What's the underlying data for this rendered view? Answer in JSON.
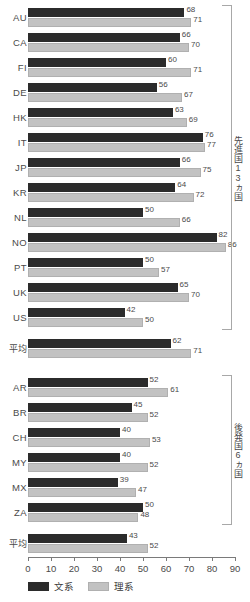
{
  "chart_data": {
    "type": "bar",
    "orientation": "horizontal",
    "title": "",
    "xlabel": "",
    "ylabel": "",
    "xlim": [
      0,
      90
    ],
    "xticks": [
      0,
      10,
      20,
      30,
      40,
      50,
      60,
      70,
      80,
      90
    ],
    "grid": false,
    "legend_position": "bottom-left",
    "series": [
      {
        "name": "文系",
        "color": "#2b2b2b"
      },
      {
        "name": "理系",
        "color": "#c2c2c2"
      }
    ],
    "groups": [
      {
        "bracket_label": "先進国13ヵ国",
        "categories": [
          "AU",
          "CA",
          "FI",
          "DE",
          "HK",
          "IT",
          "JP",
          "KR",
          "NL",
          "NO",
          "PT",
          "UK",
          "US"
        ],
        "values": {
          "文系": [
            68,
            66,
            60,
            56,
            63,
            76,
            66,
            64,
            50,
            82,
            50,
            65,
            42
          ],
          "理系": [
            71,
            70,
            71,
            67,
            69,
            77,
            75,
            72,
            66,
            86,
            57,
            70,
            50
          ]
        },
        "summary": {
          "label": "平均",
          "values": {
            "文系": 62,
            "理系": 71
          }
        }
      },
      {
        "bracket_label": "後発国6ヵ国",
        "categories": [
          "AR",
          "BR",
          "CH",
          "MY",
          "MX",
          "ZA"
        ],
        "values": {
          "文系": [
            52,
            45,
            40,
            40,
            39,
            50
          ],
          "理系": [
            61,
            52,
            53,
            52,
            47,
            48
          ]
        },
        "summary": {
          "label": "平均",
          "values": {
            "文系": 43,
            "理系": 52
          }
        }
      }
    ]
  },
  "legend": {
    "items": [
      {
        "label": "文系",
        "color": "#2b2b2b"
      },
      {
        "label": "理系",
        "color": "#c2c2c2"
      }
    ]
  }
}
